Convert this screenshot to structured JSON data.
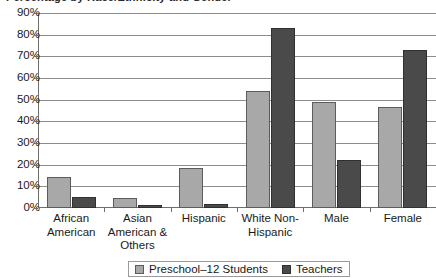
{
  "title_remnant": "Percentage by Race/Ethnicity and Gender",
  "chart_data": {
    "type": "bar",
    "title": "",
    "xlabel": "",
    "ylabel": "",
    "ylim": [
      0,
      90
    ],
    "ytick_step": 10,
    "grid": true,
    "legend_position": "bottom",
    "categories": [
      "African American",
      "Asian American & Others",
      "Hispanic",
      "White Non-Hispanic",
      "Male",
      "Female"
    ],
    "category_lines": [
      [
        "African",
        "American"
      ],
      [
        "Asian",
        "American &",
        "Others"
      ],
      [
        "Hispanic"
      ],
      [
        "White Non-",
        "Hispanic"
      ],
      [
        "Male"
      ],
      [
        "Female"
      ]
    ],
    "ytick_labels": [
      "90%",
      "80%",
      "70%",
      "60%",
      "50%",
      "40%",
      "30%",
      "20%",
      "10%",
      "0%"
    ],
    "ytick_values": [
      90,
      80,
      70,
      60,
      50,
      40,
      30,
      20,
      10,
      0
    ],
    "series": [
      {
        "name": "Preschool–12 Students",
        "color": "#a8a8a8",
        "values": [
          14.5,
          4.5,
          18.5,
          54,
          49,
          46.5
        ]
      },
      {
        "name": "Teachers",
        "color": "#4a4a4a",
        "values": [
          5,
          1.5,
          2,
          83,
          22,
          73
        ]
      }
    ]
  },
  "legend": {
    "entries": [
      {
        "label": "Preschool–12 Students",
        "swatch": "students"
      },
      {
        "label": "Teachers",
        "swatch": "teachers"
      }
    ]
  }
}
